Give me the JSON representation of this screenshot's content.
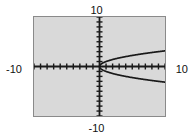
{
  "screen": {
    "title": "graphing-calculator-viewport",
    "background_color": "#ffffff",
    "plot_background_color": "#d9d9d9",
    "plot_border_color": "#8a8a8a",
    "curve_color": "#1a1a1a",
    "axis_color": "#1a1a1a"
  },
  "labels": {
    "y_max": "10",
    "y_min": "-10",
    "x_min": "-10",
    "x_max": "10"
  },
  "chart_data": {
    "type": "line",
    "title": "",
    "subtitle": "",
    "xlabel": "",
    "ylabel": "",
    "xlim": [
      -10,
      10
    ],
    "ylim": [
      -10,
      10
    ],
    "grid": false,
    "legend": "none",
    "axis_ticks": {
      "x_tick_interval": 1,
      "y_tick_interval": 1,
      "x_tick_count": 20,
      "y_tick_count": 20,
      "tick_style": "short-marks-on-axis"
    },
    "annotations": [
      {
        "text": "10",
        "position": "top-center",
        "meaning": "y-axis maximum"
      },
      {
        "text": "-10",
        "position": "bottom-center",
        "meaning": "y-axis minimum"
      },
      {
        "text": "-10",
        "position": "left-middle",
        "meaning": "x-axis minimum"
      },
      {
        "text": "10",
        "position": "right-middle",
        "meaning": "x-axis maximum"
      }
    ],
    "series": [
      {
        "name": "upper-branch",
        "equation": "y = sqrt(x)",
        "x": [
          0,
          0.25,
          0.5,
          1,
          1.5,
          2,
          3,
          4,
          5,
          6,
          7,
          8,
          9,
          10
        ],
        "y": [
          0,
          0.5,
          0.707,
          1,
          1.225,
          1.414,
          1.732,
          2,
          2.236,
          2.449,
          2.646,
          2.828,
          3,
          3.162
        ]
      },
      {
        "name": "lower-branch",
        "equation": "y = -sqrt(x)",
        "x": [
          0,
          0.25,
          0.5,
          1,
          1.5,
          2,
          3,
          4,
          5,
          6,
          7,
          8,
          9,
          10
        ],
        "y": [
          0,
          -0.5,
          -0.707,
          -1,
          -1.225,
          -1.414,
          -1.732,
          -2,
          -2.236,
          -2.449,
          -2.646,
          -2.828,
          -3,
          -3.162
        ]
      }
    ]
  }
}
